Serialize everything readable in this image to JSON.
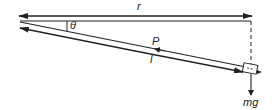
{
  "diagram": {
    "labels": {
      "r": "r",
      "theta": "θ",
      "P": "P",
      "l": "l",
      "mg": "mg"
    },
    "colors": {
      "stroke": "#222222",
      "background": "#ffffff"
    }
  }
}
